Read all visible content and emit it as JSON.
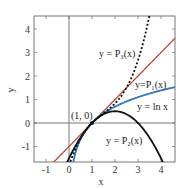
{
  "chart_data": {
    "type": "line",
    "title": "",
    "xlabel": "x",
    "ylabel": "y",
    "xlim": [
      -1.5,
      4.6
    ],
    "ylim": [
      -1.65,
      4.55
    ],
    "xticks": [
      -1,
      0,
      1,
      2,
      3,
      4
    ],
    "yticks": [
      -1,
      0,
      1,
      2,
      3,
      4
    ],
    "xtick_labels": [
      "-1",
      "0",
      "1",
      "2",
      "3",
      "4"
    ],
    "ytick_labels": [
      "-1",
      "0",
      "1",
      "2",
      "3",
      "4"
    ],
    "grid": false,
    "legend": "inline labels",
    "annotation": {
      "text": "(1, 0)",
      "x": 1,
      "y": 0
    },
    "series": [
      {
        "name": "y = P₃(x)",
        "formula": "(x-1) - (x-1)^2/2 + (x-1)^3/3",
        "color": "#111111",
        "style": "dotted"
      },
      {
        "name": "y=P₁(x)",
        "formula": "x-1",
        "color": "#b5473c",
        "style": "solid"
      },
      {
        "name": "y = ln x",
        "formula": "ln(x)",
        "color": "#2f78c4",
        "style": "solid"
      },
      {
        "name": "y = P₂(x)",
        "formula": "(x-1) - (x-1)^2/2",
        "color": "#111111",
        "style": "solid"
      }
    ]
  },
  "labels": {
    "p3": "y = P₃(x)",
    "p1": "y=P₁(x)",
    "ln": "y = ln x",
    "p2": "y = P₂(x)",
    "point": "(1, 0)",
    "xlabel": "x",
    "ylabel": "y"
  }
}
